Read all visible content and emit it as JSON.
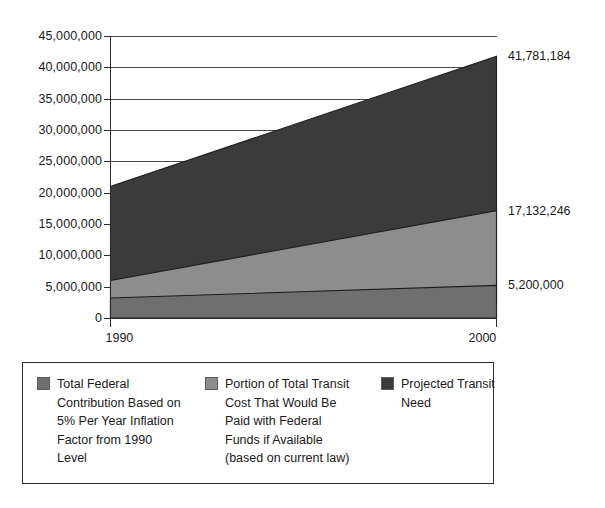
{
  "chart_data": {
    "type": "area",
    "title": "",
    "subtitle": "",
    "xlabel": "",
    "ylabel": "",
    "x": [
      1990,
      2000
    ],
    "xlim": [
      1990,
      2000
    ],
    "ylim": [
      0,
      45000000
    ],
    "x_tick_labels": [
      "1990",
      "2000"
    ],
    "y_tick_labels": [
      "0",
      "5,000,000",
      "10,000,000",
      "15,000,000",
      "20,000,000",
      "25,000,000",
      "30,000,000",
      "35,000,000",
      "40,000,000",
      "45,000,000"
    ],
    "y_tick_values": [
      0,
      5000000,
      10000000,
      15000000,
      20000000,
      25000000,
      30000000,
      35000000,
      40000000,
      45000000
    ],
    "grid": true,
    "grid_orientation": "horizontal",
    "legend_position": "bottom",
    "stacking": "overlapping-from-zero",
    "series": [
      {
        "name": "Projected Transit Need",
        "values": [
          21000000,
          41781184
        ],
        "color": "#3b3b3b",
        "end_label": "41,781,184"
      },
      {
        "name": "Portion of Total Transit Cost That Would Be Paid with Federal Funds if Available (based on current law)",
        "values": [
          6000000,
          17132246
        ],
        "color": "#8d8d8d",
        "end_label": "17,132,246"
      },
      {
        "name": "Total Federal Contribution Based on 5% Per Year Inflation Factor from 1990 Level",
        "values": [
          3200000,
          5200000
        ],
        "color": "#6f6f6f",
        "end_label": "5,200,000"
      }
    ],
    "value_callouts": [
      {
        "text": "41,781,184",
        "value": 41781184
      },
      {
        "text": "17,132,246",
        "value": 17132246
      },
      {
        "text": "5,200,000",
        "value": 5200000
      }
    ]
  },
  "legend": {
    "entries": [
      {
        "label": "Total Federal\nContribution Based on\n5% Per Year Inflation\nFactor from 1990\nLevel",
        "color": "#6f6f6f"
      },
      {
        "label": "Portion of Total Transit\nCost That Would Be\nPaid with Federal\nFunds if Available\n(based on current law)",
        "color": "#8d8d8d"
      },
      {
        "label": "Projected Transit\nNeed",
        "color": "#3b3b3b"
      }
    ]
  },
  "axis": {
    "line_color": "#2b2b2b",
    "grid_color": "#4a4a4a"
  }
}
